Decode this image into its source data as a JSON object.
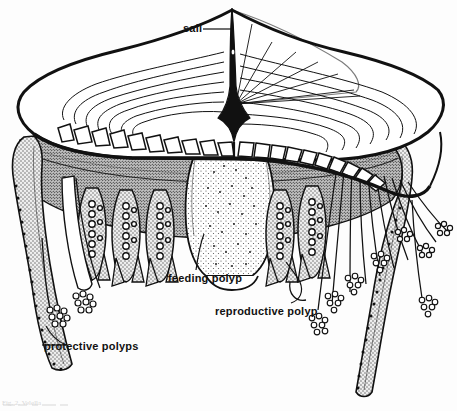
{
  "figure": {
    "domain": "Natural-Image",
    "kind": "scientific line illustration",
    "background_color": "#fdfdfd",
    "ink_color": "#111111",
    "stipple_color": "#555555",
    "width": 457,
    "height": 411
  },
  "labels": [
    {
      "id": "sail",
      "text": "sail",
      "x": 183,
      "y": 22,
      "leader": "horizontal line to right, to sail base"
    },
    {
      "id": "feeding_polyp",
      "text": "feeding polyp",
      "x": 168,
      "y": 272,
      "leader": "curved line up-right to central polyp"
    },
    {
      "id": "reproductive_polyp",
      "text": "reproductive polyp",
      "x": 215,
      "y": 305,
      "leader": "hooked line up-right to polyp cluster"
    },
    {
      "id": "protective_polyps",
      "text": "protective polyps",
      "x": 44,
      "y": 340,
      "leader": "line left to outer tentacle tip"
    }
  ],
  "caption": {
    "text": "Fig. 2. Velella",
    "visible": "partially cropped at bottom edge"
  },
  "structures": [
    {
      "name": "sail",
      "note": "tall thin black triangular fin rising from center of float"
    },
    {
      "name": "float",
      "note": "flattened oval disc with concentric air-chamber rings"
    },
    {
      "name": "chamber_rings",
      "note": "nested arcs inside float, radial struts fanning from sail base"
    },
    {
      "name": "rib_margin",
      "note": "row of small loop cells along lower edge of float"
    },
    {
      "name": "stippled_body_mass",
      "note": "dark stippled tissue mass beneath float"
    },
    {
      "name": "central_feeding_polyp",
      "note": "large bulbous stippled polyp hanging at center"
    },
    {
      "name": "reproductive_polyps",
      "note": "clustered beaded branching polyps flanking feeding polyp"
    },
    {
      "name": "protective_polyps",
      "note": "long marginal tentacles with knobbed granular tips"
    }
  ]
}
